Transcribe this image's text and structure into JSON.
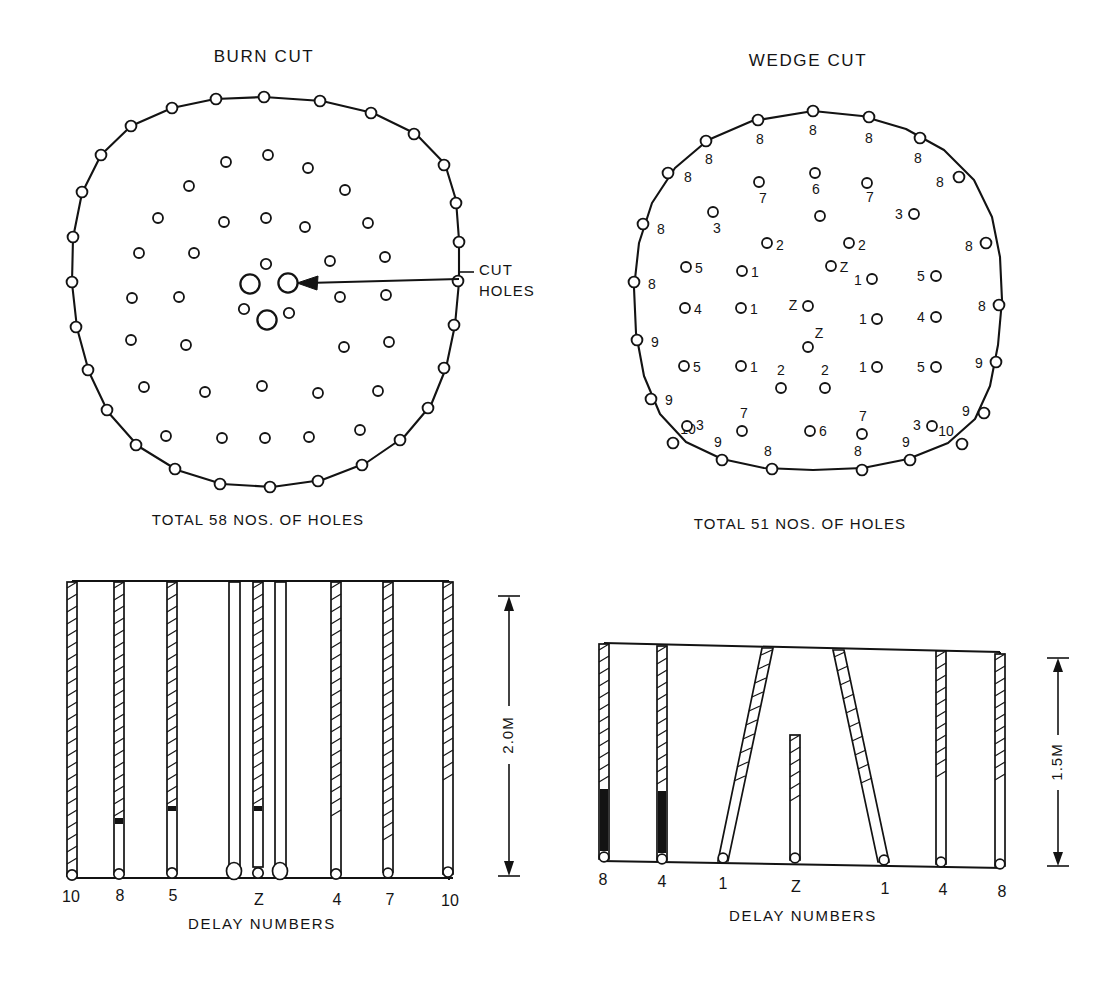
{
  "page": {
    "background": "#ffffff",
    "ink": "#131313"
  },
  "panels": {
    "burn_cut": {
      "title": "BURN CUT",
      "total_label": "TOTAL 58 NOS. OF HOLES",
      "callout": {
        "line1": "CUT",
        "line2": "HOLES"
      },
      "perimeter_hole_count": 26,
      "interior_hole_count": 26,
      "cut_hole_count": 6
    },
    "wedge_cut": {
      "title": "WEDGE CUT",
      "total_label": "TOTAL 51 NOS. OF HOLES",
      "perimeter_holes": [
        {
          "label": "8",
          "side": "top-left"
        },
        {
          "label": "8",
          "side": "top"
        },
        {
          "label": "8",
          "side": "top"
        },
        {
          "label": "8",
          "side": "top-right"
        },
        {
          "label": "8",
          "side": "upper-left"
        },
        {
          "label": "8",
          "side": "upper-left"
        },
        {
          "label": "8",
          "side": "left"
        },
        {
          "label": "8",
          "side": "left"
        },
        {
          "label": "9",
          "side": "lower-left"
        },
        {
          "label": "9",
          "side": "lower-left"
        },
        {
          "label": "10",
          "side": "bottom-left"
        },
        {
          "label": "9",
          "side": "bottom"
        },
        {
          "label": "8",
          "side": "bottom"
        },
        {
          "label": "8",
          "side": "bottom"
        },
        {
          "label": "9",
          "side": "bottom"
        },
        {
          "label": "10",
          "side": "bottom-right"
        },
        {
          "label": "9",
          "side": "lower-right"
        },
        {
          "label": "9",
          "side": "lower-right"
        },
        {
          "label": "8",
          "side": "right"
        },
        {
          "label": "8",
          "side": "right"
        },
        {
          "label": "8",
          "side": "upper-right"
        },
        {
          "label": "8",
          "side": "upper-right"
        }
      ],
      "interior_holes": [
        {
          "label": "7",
          "pos": "row1-left"
        },
        {
          "label": "6",
          "pos": "row1-center"
        },
        {
          "label": "7",
          "pos": "row1-right"
        },
        {
          "label": "3",
          "pos": "row2-left"
        },
        {
          "label": "",
          "pos": "row2-center"
        },
        {
          "label": "3",
          "pos": "row2-right"
        },
        {
          "label": "2",
          "pos": "row3-left"
        },
        {
          "label": "2",
          "pos": "row3-right"
        },
        {
          "label": "5",
          "pos": "row4-far-left"
        },
        {
          "label": "1",
          "pos": "row4-left"
        },
        {
          "label": "Z",
          "pos": "row4-center"
        },
        {
          "label": "1",
          "pos": "row4-right"
        },
        {
          "label": "5",
          "pos": "row4-far-right"
        },
        {
          "label": "4",
          "pos": "row5-far-left"
        },
        {
          "label": "1",
          "pos": "row5-left"
        },
        {
          "label": "Z",
          "pos": "row5-center"
        },
        {
          "label": "1",
          "pos": "row5-right"
        },
        {
          "label": "4",
          "pos": "row5-far-right"
        },
        {
          "label": "Z",
          "pos": "row6-center"
        },
        {
          "label": "5",
          "pos": "row7-far-left"
        },
        {
          "label": "1",
          "pos": "row7-left"
        },
        {
          "label": "2",
          "pos": "row7-midleft"
        },
        {
          "label": "2",
          "pos": "row7-midright"
        },
        {
          "label": "1",
          "pos": "row7-right"
        },
        {
          "label": "5",
          "pos": "row7-far-right"
        },
        {
          "label": "3",
          "pos": "row8-far-left"
        },
        {
          "label": "7",
          "pos": "row8-left"
        },
        {
          "label": "6",
          "pos": "row8-center"
        },
        {
          "label": "7",
          "pos": "row8-right"
        },
        {
          "label": "3",
          "pos": "row8-far-right"
        }
      ]
    },
    "burn_section": {
      "caption": "DELAY NUMBERS",
      "depth_label": "2.0M",
      "delay_numbers": [
        "10",
        "8",
        "5",
        "Z",
        "4",
        "7",
        "10"
      ]
    },
    "wedge_section": {
      "caption": "DELAY NUMBERS",
      "depth_label": "1.5M",
      "delay_numbers": [
        "8",
        "4",
        "1",
        "Z",
        "1",
        "4",
        "8"
      ]
    }
  }
}
